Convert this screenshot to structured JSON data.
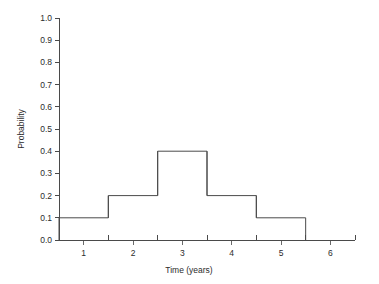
{
  "chart_data": {
    "type": "bar",
    "title": "",
    "subtitle": "",
    "xlabel": "Time (years)",
    "ylabel": "Probability",
    "categories": [
      "1",
      "2",
      "3",
      "4",
      "5",
      "6"
    ],
    "values": [
      0.1,
      0.2,
      0.4,
      0.2,
      0.1,
      0.0
    ],
    "x": [
      1,
      2,
      3,
      4,
      5,
      6
    ],
    "bin_edges": [
      0.5,
      1.5,
      2.5,
      3.5,
      4.5,
      5.5
    ],
    "xlim": [
      0.5,
      6.5
    ],
    "ylim": [
      0.0,
      1.0
    ],
    "y_ticks": [
      0.0,
      0.1,
      0.2,
      0.3,
      0.4,
      0.5,
      0.6,
      0.7,
      0.8,
      0.9,
      1.0
    ],
    "y_tick_labels": [
      "0.0",
      "0.1",
      "0.2",
      "0.3",
      "0.4",
      "0.5",
      "0.6",
      "0.7",
      "0.8",
      "0.9",
      "1.0"
    ],
    "x_ticks": [
      1,
      2,
      3,
      4,
      5,
      6
    ],
    "x_tick_labels": [
      "1",
      "2",
      "3",
      "4",
      "5",
      "6"
    ],
    "x_minor_ticks": [
      0.5,
      1.5,
      2.5,
      3.5,
      4.5,
      5.5,
      6.5
    ],
    "grid": false,
    "legend": false,
    "legend_position": "none",
    "bar_style": "outline",
    "series": [
      {
        "name": "Probability",
        "values": [
          0.1,
          0.2,
          0.4,
          0.2,
          0.1,
          0.0
        ]
      }
    ],
    "colors": {
      "bar_stroke": "#4a4a4a",
      "bar_fill": "none",
      "axis": "#4a4a4a",
      "text": "#2b2b2b",
      "background": "#ffffff"
    }
  }
}
